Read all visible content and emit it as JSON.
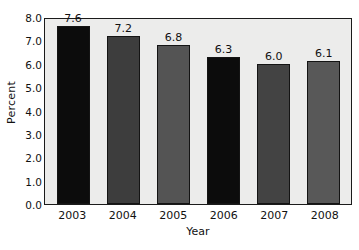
{
  "chart_data": {
    "type": "bar",
    "title": "",
    "subtitle": "",
    "xlabel": "Year",
    "ylabel": "Percent",
    "categories": [
      "2003",
      "2004",
      "2005",
      "2006",
      "2007",
      "2008"
    ],
    "values": [
      7.6,
      7.2,
      6.8,
      6.3,
      6.0,
      6.1
    ],
    "data_labels": [
      "7.6",
      "7.2",
      "6.8",
      "6.3",
      "6.0",
      "6.1"
    ],
    "bar_colors": [
      "#0c0c0c",
      "#3d3d3d",
      "#545454",
      "#0c0c0c",
      "#434343",
      "#585858"
    ],
    "bar_edge_color": "#141414",
    "ylim": [
      0.0,
      8.0
    ],
    "ytick_labels": [
      "8.0",
      "7.0",
      "6.0",
      "5.0",
      "4.0",
      "3.0",
      "2.0",
      "1.0",
      "0.0"
    ],
    "ytick_values": [
      8.0,
      7.0,
      6.0,
      5.0,
      4.0,
      3.0,
      2.0,
      1.0,
      0.0
    ],
    "grid": false,
    "legend": null,
    "plot_background": "#ececeb",
    "frame_color": "#1b1b1b",
    "figure_background": "#ffffff"
  }
}
